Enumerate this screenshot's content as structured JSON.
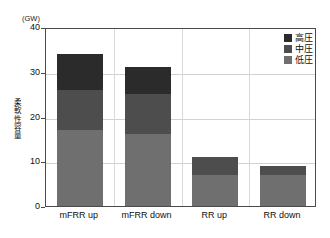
{
  "chart_data": {
    "type": "bar",
    "title": "",
    "subtitle": "",
    "stacked": true,
    "orientation": "vertical",
    "unit_label": "(GW)",
    "xlabel": "",
    "ylabel": "柔軟性容量",
    "ylim": [
      0,
      40
    ],
    "yticks": [
      0,
      10,
      20,
      30,
      40
    ],
    "ytick_labels": [
      "0",
      "10",
      "20",
      "30",
      "40"
    ],
    "grid": true,
    "grid_axis": "y",
    "legend_position": "top-right",
    "categories": [
      "mFRR up",
      "mFRR down",
      "RR up",
      "RR down"
    ],
    "series": [
      {
        "name": "低圧",
        "color": "#6f6f6f",
        "values": [
          17,
          16,
          7,
          7
        ]
      },
      {
        "name": "中圧",
        "color": "#4d4d4d",
        "values": [
          9,
          9,
          4,
          2
        ]
      },
      {
        "name": "高圧",
        "color": "#2b2b2b",
        "values": [
          8,
          6,
          0,
          0
        ]
      }
    ],
    "totals": [
      34,
      31,
      11,
      9
    ]
  },
  "legend": {
    "items": [
      {
        "label": "高圧",
        "color": "#2b2b2b"
      },
      {
        "label": "中圧",
        "color": "#4d4d4d"
      },
      {
        "label": "低圧",
        "color": "#6f6f6f"
      }
    ]
  },
  "colors": {
    "background": "#ffffff",
    "axis": "#4a4a4a",
    "gridline": "#d2d2d2",
    "text": "#101010"
  }
}
